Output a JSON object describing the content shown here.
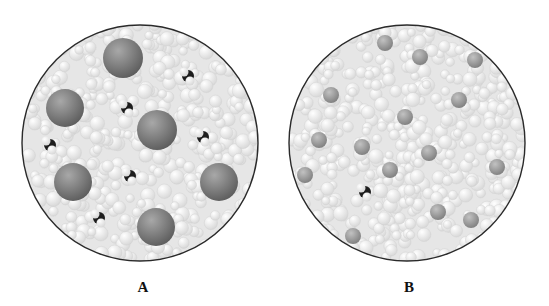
{
  "figure": {
    "panels": [
      {
        "label": "A",
        "description": "Solvent (light small spheres) with large solute particles and a few small dark molecules",
        "circle": {
          "cx": 140,
          "cy": 143,
          "r": 118
        },
        "large_particles": [
          {
            "x": 123,
            "y": 58,
            "r": 20
          },
          {
            "x": 65,
            "y": 108,
            "r": 19
          },
          {
            "x": 157,
            "y": 130,
            "r": 20
          },
          {
            "x": 73,
            "y": 182,
            "r": 19
          },
          {
            "x": 219,
            "y": 182,
            "r": 19
          },
          {
            "x": 156,
            "y": 227,
            "r": 19
          }
        ],
        "dark_molecules": [
          {
            "x": 188,
            "y": 76
          },
          {
            "x": 127,
            "y": 108
          },
          {
            "x": 50,
            "y": 145
          },
          {
            "x": 203,
            "y": 137
          },
          {
            "x": 130,
            "y": 176
          },
          {
            "x": 99,
            "y": 218
          }
        ]
      },
      {
        "label": "B",
        "description": "Solvent (light small spheres) with medium gray particles and one small dark molecule",
        "circle": {
          "cx": 132,
          "cy": 143,
          "r": 118
        },
        "medium_particles": [
          {
            "x": 110,
            "y": 43
          },
          {
            "x": 145,
            "y": 57
          },
          {
            "x": 56,
            "y": 95
          },
          {
            "x": 184,
            "y": 100
          },
          {
            "x": 130,
            "y": 117
          },
          {
            "x": 87,
            "y": 147
          },
          {
            "x": 154,
            "y": 153
          },
          {
            "x": 222,
            "y": 167
          },
          {
            "x": 44,
            "y": 140
          },
          {
            "x": 163,
            "y": 212
          },
          {
            "x": 78,
            "y": 236
          },
          {
            "x": 200,
            "y": 60
          },
          {
            "x": 30,
            "y": 175
          },
          {
            "x": 115,
            "y": 170
          },
          {
            "x": 196,
            "y": 220
          }
        ],
        "dark_molecules": [
          {
            "x": 90,
            "y": 192
          }
        ]
      }
    ],
    "colors": {
      "outline": "#2a2a2a",
      "solvent_light": "#f4f4f4",
      "solvent_mid": "#d9d9d9",
      "large_particle": "#7a7a7a",
      "medium_particle": "#9a9a9a",
      "dark_molecule": "#1e1e1e"
    }
  }
}
